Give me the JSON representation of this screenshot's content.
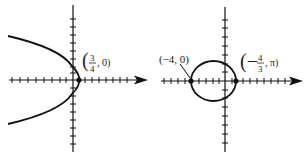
{
  "figures": [
    {
      "id": "left",
      "curve": "parabola opening left",
      "point_label": {
        "open": "(",
        "num": "3",
        "den": "4",
        "rest": ", 0)"
      },
      "point": "(3/4, 0)"
    },
    {
      "id": "right",
      "curve": "ellipse",
      "point_labels": [
        {
          "text": "(−4, 0)"
        },
        {
          "open": "(−",
          "num": "4",
          "den": "3",
          "rest": ", π)"
        }
      ],
      "points": [
        "(-4, 0)",
        "(-4/3, π)"
      ]
    }
  ],
  "colors": {
    "ink": "#111111",
    "background": "#ffffff"
  }
}
